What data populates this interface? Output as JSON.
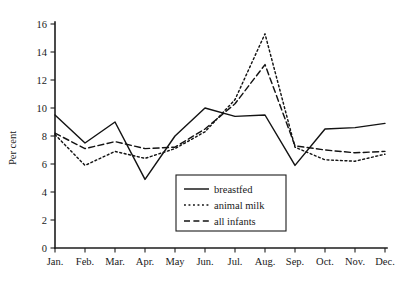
{
  "chart_data": {
    "type": "line",
    "title": "",
    "xlabel": "",
    "ylabel": "Per cent",
    "categories": [
      "Jan.",
      "Feb.",
      "Mar.",
      "Apr.",
      "May",
      "Jun.",
      "Jul.",
      "Aug.",
      "Sep.",
      "Oct.",
      "Nov.",
      "Dec."
    ],
    "ylim": [
      0,
      16
    ],
    "yticks": [
      0,
      2,
      4,
      6,
      8,
      10,
      12,
      14,
      16
    ],
    "ytick_labels": [
      "0",
      "2",
      "4",
      "6",
      "8",
      "10",
      "12",
      "14",
      "16"
    ],
    "grid": false,
    "legend_position": "lower-center-left",
    "series": [
      {
        "name": "breastfed",
        "style": "solid",
        "values": [
          9.5,
          7.5,
          9.0,
          4.9,
          8.0,
          10.0,
          9.4,
          9.5,
          5.9,
          8.5,
          8.6,
          8.9
        ]
      },
      {
        "name": "animal milk",
        "style": "dotted",
        "values": [
          8.1,
          5.9,
          6.9,
          6.4,
          7.1,
          8.3,
          10.6,
          15.3,
          7.2,
          6.3,
          6.2,
          6.7
        ]
      },
      {
        "name": "all infants",
        "style": "dashed",
        "values": [
          8.2,
          7.1,
          7.6,
          7.1,
          7.2,
          8.5,
          10.3,
          13.1,
          7.3,
          7.0,
          6.8,
          6.9
        ]
      }
    ]
  },
  "legend": {
    "items": [
      {
        "label": "breastfed"
      },
      {
        "label": "animal milk"
      },
      {
        "label": "all infants"
      }
    ]
  },
  "axes": {
    "y_title": "Per cent"
  }
}
